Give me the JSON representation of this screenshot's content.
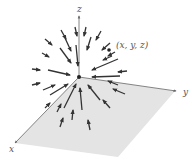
{
  "figure": {
    "type": "vector-field-3d",
    "axes": {
      "x_label": "x",
      "y_label": "y",
      "z_label": "z"
    },
    "point_label": "(x, y, z)",
    "colors": {
      "plane_fill": "#e4e4e4",
      "arrow": "#333333",
      "axis": "#666666",
      "label": "#555555"
    }
  },
  "arrows": [
    {
      "x1": 75,
      "y1": 27,
      "x2": 77,
      "y2": 36
    },
    {
      "x1": 86,
      "y1": 27,
      "x2": 84,
      "y2": 36
    },
    {
      "x1": 61,
      "y1": 30,
      "x2": 66,
      "y2": 39
    },
    {
      "x1": 101,
      "y1": 31,
      "x2": 96,
      "y2": 40
    },
    {
      "x1": 45,
      "y1": 39,
      "x2": 52,
      "y2": 45
    },
    {
      "x1": 65,
      "y1": 38,
      "x2": 71,
      "y2": 51
    },
    {
      "x1": 91,
      "y1": 37,
      "x2": 87,
      "y2": 50
    },
    {
      "x1": 110,
      "y1": 43,
      "x2": 102,
      "y2": 50
    },
    {
      "x1": 42,
      "y1": 53,
      "x2": 49,
      "y2": 57
    },
    {
      "x1": 60,
      "y1": 48,
      "x2": 71,
      "y2": 63
    },
    {
      "x1": 76,
      "y1": 45,
      "x2": 78,
      "y2": 66
    },
    {
      "x1": 112,
      "y1": 56,
      "x2": 103,
      "y2": 60
    },
    {
      "x1": 118,
      "y1": 59,
      "x2": 92,
      "y2": 70
    },
    {
      "x1": 32,
      "y1": 69,
      "x2": 40,
      "y2": 70
    },
    {
      "x1": 48,
      "y1": 70,
      "x2": 70,
      "y2": 75
    },
    {
      "x1": 127,
      "y1": 71,
      "x2": 118,
      "y2": 72
    },
    {
      "x1": 120,
      "y1": 76,
      "x2": 92,
      "y2": 77
    },
    {
      "x1": 32,
      "y1": 85,
      "x2": 40,
      "y2": 83
    },
    {
      "x1": 50,
      "y1": 95,
      "x2": 68,
      "y2": 84
    },
    {
      "x1": 43,
      "y1": 90,
      "x2": 55,
      "y2": 85
    },
    {
      "x1": 125,
      "y1": 94,
      "x2": 113,
      "y2": 89
    },
    {
      "x1": 118,
      "y1": 85,
      "x2": 108,
      "y2": 81
    },
    {
      "x1": 64,
      "y1": 108,
      "x2": 76,
      "y2": 84
    },
    {
      "x1": 82,
      "y1": 110,
      "x2": 80,
      "y2": 88
    },
    {
      "x1": 100,
      "y1": 100,
      "x2": 88,
      "y2": 85
    },
    {
      "x1": 57,
      "y1": 112,
      "x2": 61,
      "y2": 104
    },
    {
      "x1": 72,
      "y1": 120,
      "x2": 73,
      "y2": 110
    },
    {
      "x1": 110,
      "y1": 108,
      "x2": 103,
      "y2": 100
    },
    {
      "x1": 60,
      "y1": 127,
      "x2": 63,
      "y2": 118
    },
    {
      "x1": 90,
      "y1": 130,
      "x2": 88,
      "y2": 120
    },
    {
      "x1": 45,
      "y1": 108,
      "x2": 50,
      "y2": 103
    },
    {
      "x1": 115,
      "y1": 52,
      "x2": 108,
      "y2": 56
    }
  ]
}
